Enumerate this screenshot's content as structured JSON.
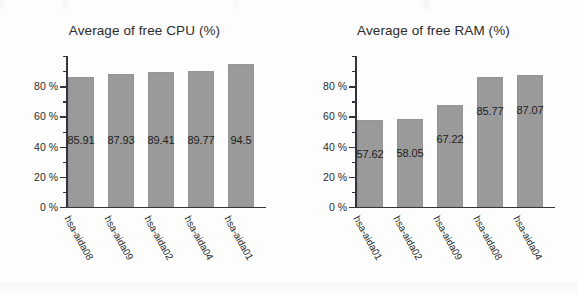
{
  "page": {
    "background_color": "#fdfdfd",
    "bar_color": "#9a9a9a",
    "axis_color": "#34343a",
    "text_color": "#2b2b2b"
  },
  "chart_data": [
    {
      "type": "bar",
      "title": "Average of free CPU (%)",
      "xlabel": "",
      "ylabel": "",
      "ylim": [
        0,
        100
      ],
      "yticks": [
        0,
        20,
        40,
        60,
        80
      ],
      "ytick_labels": [
        "0 %",
        "20 %",
        "40 %",
        "60 %",
        "80 %"
      ],
      "minor_tick_step": 10,
      "grid": false,
      "legend": "none",
      "categories": [
        "hsa-aida08",
        "hsa-aida09",
        "hsa-aida02",
        "hsa-aida04",
        "hsa-aida01"
      ],
      "values": [
        85.91,
        87.93,
        89.41,
        89.77,
        94.5
      ],
      "value_labels": [
        "85.91",
        "87.93",
        "89.41",
        "89.77",
        "94.5"
      ]
    },
    {
      "type": "bar",
      "title": "Average of free RAM (%)",
      "xlabel": "",
      "ylabel": "",
      "ylim": [
        0,
        100
      ],
      "yticks": [
        0,
        20,
        40,
        60,
        80
      ],
      "ytick_labels": [
        "0 %",
        "20 %",
        "40 %",
        "60 %",
        "80 %"
      ],
      "minor_tick_step": 10,
      "grid": false,
      "legend": "none",
      "categories": [
        "hsa-aida01",
        "hsa-aida02",
        "hsa-aida09",
        "hsa-aida08",
        "hsa-aida04"
      ],
      "values": [
        57.62,
        58.05,
        67.22,
        85.77,
        87.07
      ],
      "value_labels": [
        "57.62",
        "58.05",
        "67.22",
        "85.77",
        "87.07"
      ]
    }
  ]
}
